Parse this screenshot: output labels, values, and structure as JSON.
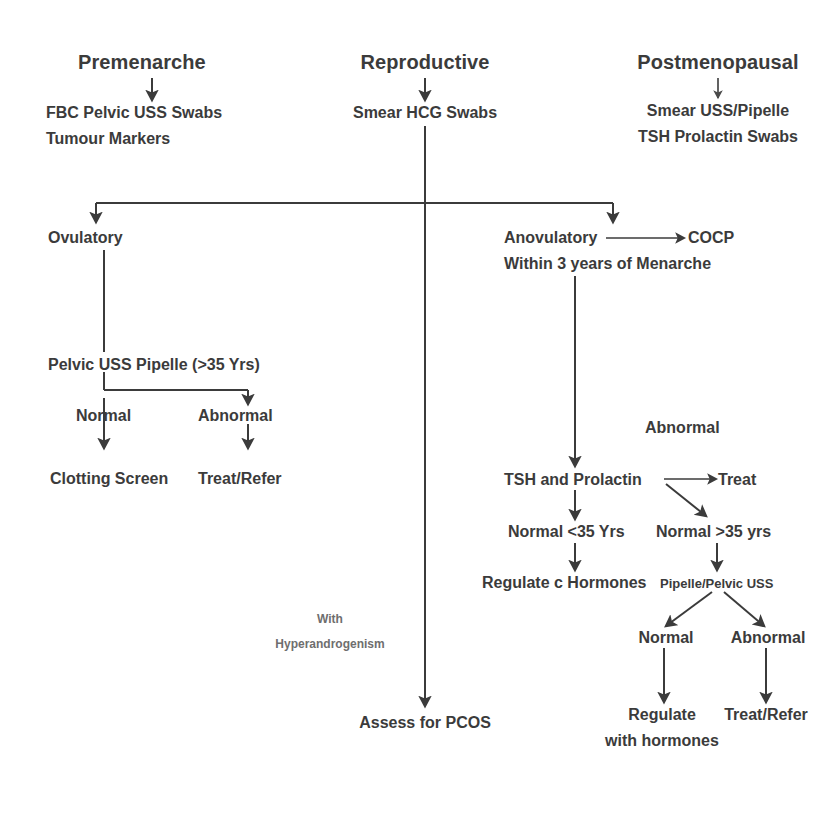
{
  "diagram": {
    "background_color": "#ffffff",
    "ink_color": "#3b3b3b",
    "faint_ink_color": "#6e6e6e"
  },
  "columns": {
    "premenarche": {
      "header": "Premenarche",
      "tests_line1": "FBC Pelvic USS Swabs",
      "tests_line2": "Tumour Markers"
    },
    "reproductive": {
      "header": "Reproductive",
      "tests_line1": "Smear HCG Swabs"
    },
    "postmenopausal": {
      "header": "Postmenopausal",
      "tests_line1": "Smear USS/Pipelle",
      "tests_line2": "TSH Prolactin Swabs"
    }
  },
  "branches": {
    "ovulatory": "Ovulatory",
    "anovulatory": "Anovulatory",
    "anovulatory_note": "Within 3 years of Menarche",
    "cocp": "COCP"
  },
  "ovulatory_path": {
    "investigations": "Pelvic USS  Pipelle (>35 Yrs)",
    "normal": "Normal",
    "abnormal": "Abnormal",
    "normal_outcome": "Clotting Screen",
    "abnormal_outcome": "Treat/Refer"
  },
  "anovulatory_path": {
    "abnormal_label": "Abnormal",
    "tests": "TSH and Prolactin",
    "treat": "Treat",
    "normal_under35": "Normal <35 Yrs",
    "normal_over35": "Normal >35 yrs",
    "under35_outcome": "Regulate c Hormones",
    "over35_investigation": "Pipelle/Pelvic USS",
    "over35_normal": "Normal",
    "over35_abnormal": "Abnormal",
    "over35_normal_outcome_line1": "Regulate",
    "over35_normal_outcome_line2": "with hormones",
    "over35_abnormal_outcome": "Treat/Refer"
  },
  "centre_path": {
    "note_line1": "With",
    "note_line2": "Hyperandrogenism",
    "outcome": "Assess for PCOS"
  }
}
